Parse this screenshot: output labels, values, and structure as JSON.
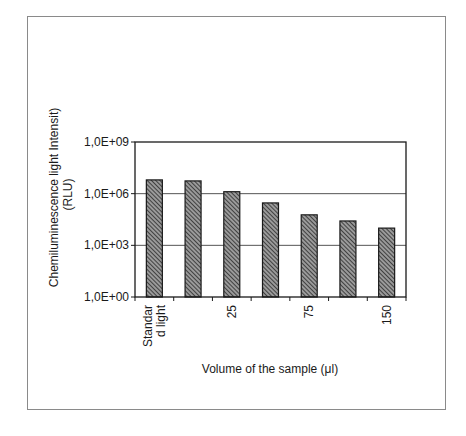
{
  "chart_data": {
    "type": "bar",
    "title": "",
    "xlabel": "Volume of the sample (μl)",
    "ylabel": "Chemiluminescence light Intensity (RLU)",
    "ylabel_lines": [
      "Chemiluminescence light Intensit)",
      "(RLU)"
    ],
    "yscale": "log",
    "ylim": [
      1,
      1000000000
    ],
    "yticks": [
      1,
      1000,
      1000000,
      1000000000
    ],
    "ytick_labels": [
      "1,0E+00",
      "1,0E+03",
      "1,0E+06",
      "1,0E+09"
    ],
    "grid": true,
    "legend": null,
    "categories": [
      "Standard light",
      "",
      "25",
      "",
      "75",
      "",
      "150"
    ],
    "category_label_lines": [
      [
        "Standar",
        "d light"
      ],
      [],
      [
        "25"
      ],
      [],
      [
        "75"
      ],
      [],
      [
        "150"
      ]
    ],
    "values": [
      6300000,
      5500000,
      1300000,
      290000,
      59000,
      26000,
      10000
    ],
    "bar_style": "diagonal-hatch"
  },
  "colors": {
    "bar_fill": "#9a9a9a",
    "bar_hatch": "#2a2a2a",
    "bar_outline": "#1a1a1a",
    "gridline": "#555555",
    "frame": "#8a8a8a"
  }
}
